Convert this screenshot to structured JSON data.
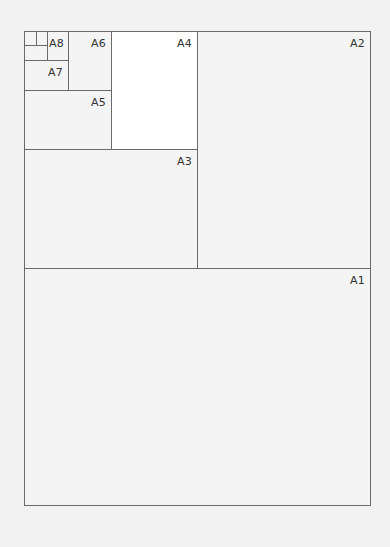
{
  "diagram": {
    "title": "",
    "sheets": [
      {
        "label": "A1"
      },
      {
        "label": "A2"
      },
      {
        "label": "A3"
      },
      {
        "label": "A4"
      },
      {
        "label": "A5"
      },
      {
        "label": "A6"
      },
      {
        "label": "A7"
      },
      {
        "label": "A8"
      },
      {
        "label": ""
      },
      {
        "label": ""
      }
    ],
    "highlight": "A4",
    "colors": {
      "line": "#6a6a6a",
      "background": "#f4f4f4",
      "highlight": "#ffffff",
      "text": "#333333"
    }
  }
}
